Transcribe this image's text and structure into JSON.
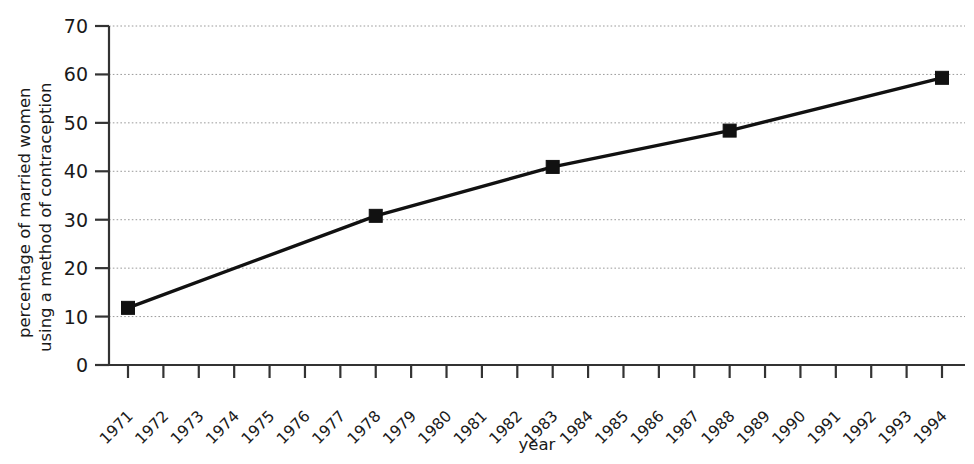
{
  "chart_data": {
    "type": "line",
    "title": "",
    "xlabel": "year",
    "ylabel": "percentage of married women using a method of contraception",
    "ylabel_line1": "percentage of married women",
    "ylabel_line2": "using a method of contraception",
    "xlim": [
      1971,
      1994
    ],
    "ylim": [
      0,
      70
    ],
    "yticks": [
      0,
      10,
      20,
      30,
      40,
      50,
      60,
      70
    ],
    "ytick_labels": [
      "0",
      "10",
      "20",
      "30",
      "40",
      "50",
      "60",
      "70"
    ],
    "xticks": [
      1971,
      1972,
      1973,
      1974,
      1975,
      1976,
      1977,
      1978,
      1979,
      1980,
      1981,
      1982,
      1983,
      1984,
      1985,
      1986,
      1987,
      1988,
      1989,
      1990,
      1991,
      1992,
      1993,
      1994
    ],
    "xtick_labels": [
      "1971",
      "1972",
      "1973",
      "1974",
      "1975",
      "1976",
      "1977",
      "1978",
      "1979",
      "1980",
      "1981",
      "1982",
      "1983",
      "1984",
      "1985",
      "1986",
      "1987",
      "1988",
      "1989",
      "1990",
      "1991",
      "1992",
      "1993",
      "1994"
    ],
    "grid": true,
    "grid_axis": "y",
    "legend": "none",
    "marker": "square",
    "line_color": "#111111",
    "marker_color": "#111111",
    "grid_color": "#9a9a9a",
    "axis_color": "#333333",
    "x": [
      1971,
      1978,
      1983,
      1988,
      1994
    ],
    "values": [
      11.8,
      30.8,
      40.9,
      48.4,
      59.3
    ],
    "series": [
      {
        "name": "percentage of married women using a method of contraception",
        "x": [
          1971,
          1978,
          1983,
          1988,
          1994
        ],
        "values": [
          11.8,
          30.8,
          40.9,
          48.4,
          59.3
        ]
      }
    ]
  }
}
